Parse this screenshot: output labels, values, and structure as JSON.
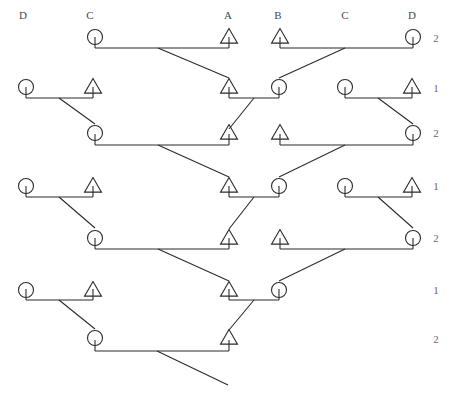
{
  "figure": {
    "type": "pedigree-chart",
    "title": "",
    "width": 453,
    "height": 399,
    "background_color": "#ffffff",
    "stroke_color": "#2b2b2b",
    "text_color": "#4a4a4a"
  },
  "column_headers": [
    {
      "label": "D",
      "x": 23
    },
    {
      "label": "C",
      "x": 90
    },
    {
      "label": "A",
      "x": 228
    },
    {
      "label": "B",
      "x": 278
    },
    {
      "label": "C",
      "x": 345
    },
    {
      "label": "D",
      "x": 412
    }
  ],
  "column_headers_y": 15,
  "generation_labels": [
    {
      "label": "2",
      "y": 38
    },
    {
      "label": "1",
      "y": 88
    },
    {
      "label": "2",
      "y": 133
    },
    {
      "label": "1",
      "y": 186
    },
    {
      "label": "2",
      "y": 238
    },
    {
      "label": "1",
      "y": 290
    },
    {
      "label": "2",
      "y": 339
    }
  ],
  "generation_labels_x": 436,
  "symbols": [
    {
      "shape": "circle",
      "x": 95,
      "y": 37,
      "row": 1
    },
    {
      "shape": "triangle",
      "x": 229,
      "y": 37,
      "row": 1
    },
    {
      "shape": "triangle",
      "x": 280,
      "y": 37,
      "row": 1
    },
    {
      "shape": "circle",
      "x": 413,
      "y": 37,
      "row": 1
    },
    {
      "shape": "circle",
      "x": 26,
      "y": 87,
      "row": 2
    },
    {
      "shape": "triangle",
      "x": 93,
      "y": 87,
      "row": 2
    },
    {
      "shape": "triangle",
      "x": 229,
      "y": 87,
      "row": 2
    },
    {
      "shape": "circle",
      "x": 279,
      "y": 87,
      "row": 2
    },
    {
      "shape": "circle",
      "x": 345,
      "y": 87,
      "row": 2
    },
    {
      "shape": "triangle",
      "x": 412,
      "y": 87,
      "row": 2
    },
    {
      "shape": "circle",
      "x": 95,
      "y": 133,
      "row": 3
    },
    {
      "shape": "triangle",
      "x": 229,
      "y": 133,
      "row": 3
    },
    {
      "shape": "triangle",
      "x": 280,
      "y": 133,
      "row": 3
    },
    {
      "shape": "circle",
      "x": 413,
      "y": 133,
      "row": 3
    },
    {
      "shape": "circle",
      "x": 26,
      "y": 186,
      "row": 4
    },
    {
      "shape": "triangle",
      "x": 93,
      "y": 186,
      "row": 4
    },
    {
      "shape": "triangle",
      "x": 229,
      "y": 186,
      "row": 4
    },
    {
      "shape": "circle",
      "x": 279,
      "y": 186,
      "row": 4
    },
    {
      "shape": "circle",
      "x": 345,
      "y": 186,
      "row": 4
    },
    {
      "shape": "triangle",
      "x": 412,
      "y": 186,
      "row": 4
    },
    {
      "shape": "circle",
      "x": 95,
      "y": 238,
      "row": 5
    },
    {
      "shape": "triangle",
      "x": 229,
      "y": 238,
      "row": 5
    },
    {
      "shape": "triangle",
      "x": 280,
      "y": 238,
      "row": 5
    },
    {
      "shape": "circle",
      "x": 413,
      "y": 238,
      "row": 5
    },
    {
      "shape": "circle",
      "x": 26,
      "y": 290,
      "row": 6
    },
    {
      "shape": "triangle",
      "x": 93,
      "y": 290,
      "row": 6
    },
    {
      "shape": "triangle",
      "x": 229,
      "y": 290,
      "row": 6
    },
    {
      "shape": "circle",
      "x": 279,
      "y": 290,
      "row": 6
    },
    {
      "shape": "circle",
      "x": 95,
      "y": 338,
      "row": 7
    },
    {
      "shape": "triangle",
      "x": 229,
      "y": 338,
      "row": 7
    }
  ],
  "mating_bars": [
    {
      "y": 48,
      "x1": 95,
      "x2": 229,
      "row": 1
    },
    {
      "y": 48,
      "x1": 280,
      "x2": 413,
      "row": 1
    },
    {
      "y": 98,
      "x1": 26,
      "x2": 93,
      "row": 2
    },
    {
      "y": 98,
      "x1": 229,
      "x2": 279,
      "row": 2
    },
    {
      "y": 98,
      "x1": 345,
      "x2": 412,
      "row": 2
    },
    {
      "y": 145,
      "x1": 95,
      "x2": 229,
      "row": 3
    },
    {
      "y": 145,
      "x1": 280,
      "x2": 413,
      "row": 3
    },
    {
      "y": 197,
      "x1": 26,
      "x2": 93,
      "row": 4
    },
    {
      "y": 197,
      "x1": 229,
      "x2": 279,
      "row": 4
    },
    {
      "y": 197,
      "x1": 345,
      "x2": 412,
      "row": 4
    },
    {
      "y": 249,
      "x1": 95,
      "x2": 229,
      "row": 5
    },
    {
      "y": 249,
      "x1": 280,
      "x2": 413,
      "row": 5
    },
    {
      "y": 300,
      "x1": 26,
      "x2": 93,
      "row": 6
    },
    {
      "y": 300,
      "x1": 229,
      "x2": 279,
      "row": 6
    },
    {
      "y": 351,
      "x1": 95,
      "x2": 229,
      "row": 7
    }
  ],
  "descent_lines": [
    {
      "x1": 158,
      "y1": 48,
      "x2": 229,
      "y2": 78
    },
    {
      "x1": 345,
      "y1": 48,
      "x2": 279,
      "y2": 78
    },
    {
      "x1": 59,
      "y1": 98,
      "x2": 95,
      "y2": 124
    },
    {
      "x1": 254,
      "y1": 98,
      "x2": 229,
      "y2": 129
    },
    {
      "x1": 378,
      "y1": 98,
      "x2": 413,
      "y2": 124
    },
    {
      "x1": 158,
      "y1": 145,
      "x2": 229,
      "y2": 177
    },
    {
      "x1": 345,
      "y1": 145,
      "x2": 279,
      "y2": 177
    },
    {
      "x1": 59,
      "y1": 197,
      "x2": 95,
      "y2": 228
    },
    {
      "x1": 254,
      "y1": 197,
      "x2": 229,
      "y2": 229
    },
    {
      "x1": 378,
      "y1": 197,
      "x2": 413,
      "y2": 228
    },
    {
      "x1": 158,
      "y1": 249,
      "x2": 229,
      "y2": 281
    },
    {
      "x1": 345,
      "y1": 249,
      "x2": 279,
      "y2": 281
    },
    {
      "x1": 59,
      "y1": 300,
      "x2": 95,
      "y2": 329
    },
    {
      "x1": 254,
      "y1": 300,
      "x2": 229,
      "y2": 330
    },
    {
      "x1": 157,
      "y1": 351,
      "x2": 228,
      "y2": 385
    }
  ]
}
